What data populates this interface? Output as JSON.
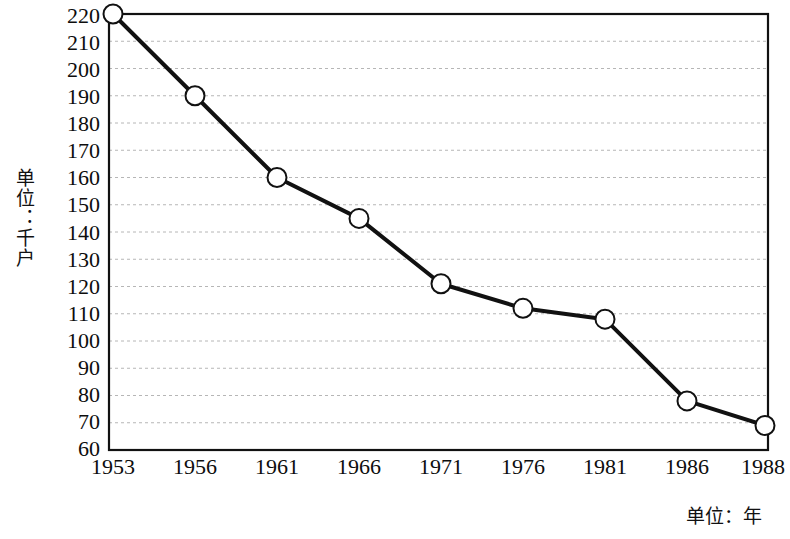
{
  "chart_data": {
    "type": "line",
    "title": "",
    "subtitle": "",
    "xlabel": "单位：年",
    "ylabel": "单位：千户",
    "categories": [
      "1953",
      "1956",
      "1961",
      "1966",
      "1971",
      "1976",
      "1981",
      "1986",
      "1988"
    ],
    "series": [
      {
        "name": "",
        "values": [
          220,
          190,
          160,
          145,
          121,
          112,
          108,
          78,
          69
        ]
      }
    ],
    "ylim": [
      60,
      220
    ],
    "ytick_step": 10,
    "yticks": [
      220,
      210,
      200,
      190,
      180,
      170,
      160,
      150,
      140,
      130,
      120,
      110,
      100,
      90,
      80,
      70,
      60
    ],
    "grid": "horizontal-dotted",
    "legend": "none",
    "marker": "open-circle",
    "line_color": "#111111",
    "marker_fill": "#ffffff",
    "marker_stroke": "#111111",
    "grid_color": "#b6b6b6",
    "frame_color": "#111111",
    "background": "#ffffff"
  }
}
